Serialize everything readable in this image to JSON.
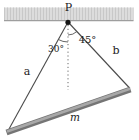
{
  "colors": {
    "background": "#ffffff",
    "ceiling_fill": "#dcdcdc",
    "ceiling_stripe": "#c8c8c8",
    "ceiling_bottom_edge": "#9e9e9e",
    "string_line": "#4a4a4a",
    "reference_line": "#6a6a6a",
    "arc": "#555555",
    "rod_body": "#757575",
    "rod_highlight": "#a8a8a8",
    "dot": "#151515",
    "text": "#1c1c1c"
  },
  "diagram": {
    "point_label": "P",
    "left_angle_label": "30°",
    "right_angle_label": "45°",
    "left_string_label": "a",
    "right_string_label": "b",
    "rod_label": "m"
  }
}
